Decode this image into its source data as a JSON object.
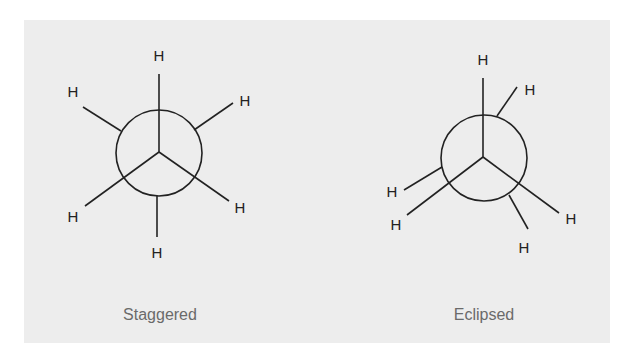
{
  "figure": {
    "background": "#ededed",
    "line_color": "#222222",
    "caption_color": "#6a6a6a",
    "projections": [
      {
        "name": "staggered",
        "caption": "Staggered",
        "front_atoms": [
          "H",
          "H",
          "H"
        ],
        "back_atoms": [
          "H",
          "H",
          "H"
        ]
      },
      {
        "name": "eclipsed",
        "caption": "Eclipsed",
        "front_atoms": [
          "H",
          "H",
          "H"
        ],
        "back_atoms": [
          "H",
          "H",
          "H"
        ]
      }
    ]
  }
}
